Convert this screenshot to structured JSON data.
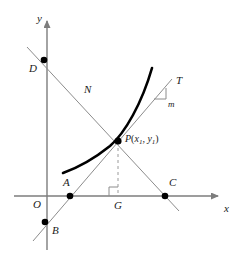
{
  "figure": {
    "background_color": "#ffffff",
    "width": 237,
    "height": 255
  },
  "colors": {
    "axis": "#7d7d7d",
    "curve": "#000000",
    "tangent_line": "#8c8c8c",
    "normal_line": "#8c8c8c",
    "dashed_line": "#9a9a9a",
    "point_marker": "#000000",
    "label_text": "#1a1a1a",
    "right_angle_marker": "#8c8c8c"
  },
  "axes": {
    "x_axis": {
      "label": "x",
      "label_x": 224,
      "label_y": 203,
      "y_pixel": 196,
      "x_start": 14,
      "x_end": 218,
      "arrow": "right"
    },
    "y_axis": {
      "label": "y",
      "label_x": 37,
      "label_y": 13,
      "x_pixel": 47,
      "y_start": 250,
      "y_end": 20,
      "arrow": "up"
    },
    "origin": {
      "label": "O",
      "label_x": 33,
      "label_y": 199,
      "x": 47,
      "y": 196
    }
  },
  "curve": {
    "name": "function-curve",
    "description": "increasing convex curve passing through P",
    "stroke_width": 2.6,
    "path": "M 63,173 C 77,168 95,158 110,146 C 125,133 142,103 152,68"
  },
  "tangent_line": {
    "name": "tangent-line-T",
    "label": "T",
    "label_x": 176,
    "label_y": 75,
    "x1": 33,
    "y1": 241,
    "x2": 172,
    "y2": 79,
    "stroke_width": 1
  },
  "normal_line": {
    "name": "normal-line-N",
    "label": "N",
    "label_x": 84,
    "label_y": 84,
    "x1": 27,
    "y1": 47,
    "x2": 179,
    "y2": 211,
    "stroke_width": 1
  },
  "dashed_line": {
    "name": "perpendicular-dashed-PG",
    "x1": 118,
    "y1": 142,
    "x2": 118,
    "y2": 195,
    "dash_pattern": "3 3",
    "stroke_width": 1
  },
  "right_angle_marker": {
    "name": "right-angle-at-G",
    "x": 118,
    "y": 196,
    "size": 9
  },
  "slope_marker": {
    "name": "slope-triangle-m",
    "label": "m",
    "label_x": 166,
    "label_y": 100,
    "apex_x": 166,
    "apex_y": 88,
    "corner_x": 166,
    "corner_y": 99,
    "base_x": 154,
    "base_y": 99
  },
  "points": [
    {
      "name": "point-D",
      "label": "D",
      "x": 44,
      "y": 60,
      "label_x": 29,
      "label_y": 63,
      "radius": 3.3,
      "description": "intersection of normal line with y-axis"
    },
    {
      "name": "point-A",
      "label": "A",
      "x": 70,
      "y": 196,
      "label_x": 63,
      "label_y": 177,
      "radius": 3.3,
      "description": "intersection of tangent line with x-axis"
    },
    {
      "name": "point-B",
      "label": "B",
      "x": 45,
      "y": 222,
      "label_x": 52,
      "label_y": 225,
      "radius": 3.3,
      "description": "intersection of tangent line with y-axis"
    },
    {
      "name": "point-C",
      "label": "C",
      "x": 165,
      "y": 196,
      "label_x": 169,
      "label_y": 177,
      "radius": 3.3,
      "description": "intersection of normal line with x-axis"
    },
    {
      "name": "point-P",
      "label": "P",
      "x": 118,
      "y": 141,
      "radius": 3.6,
      "description": "point of tangency on the curve"
    },
    {
      "name": "point-G",
      "label": "G",
      "x": 118,
      "y": 196,
      "label_x": 114,
      "label_y": 200,
      "radius": 0,
      "description": "foot of perpendicular from P to x-axis"
    }
  ],
  "point_p_label": {
    "name": "point-p-coordinates-label",
    "text_prefix": "P",
    "open_paren": "(",
    "x_var": "x",
    "x_sub": "1",
    "comma": ", ",
    "y_var": "y",
    "y_sub": "1",
    "close_paren": ")",
    "label_x": 125,
    "label_y": 135,
    "full_text": "P(x1, y1)"
  }
}
